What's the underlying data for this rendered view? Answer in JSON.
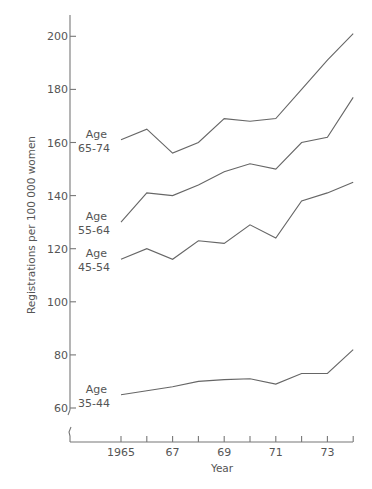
{
  "chart_data": {
    "type": "line",
    "title": "",
    "xlabel": "Year",
    "ylabel": "Registrations per 100 000 women",
    "x": [
      1965,
      1966,
      1967,
      1968,
      1969,
      1970,
      1971,
      1972,
      1973,
      1974
    ],
    "x_ticks": [
      1965,
      1966,
      1967,
      1968,
      1969,
      1970,
      1971,
      1972,
      1973,
      1974
    ],
    "x_tick_labels": [
      {
        "value": 1965,
        "label": "1965"
      },
      {
        "value": 1967,
        "label": "67"
      },
      {
        "value": 1969,
        "label": "69"
      },
      {
        "value": 1971,
        "label": "71"
      },
      {
        "value": 1973,
        "label": "73"
      }
    ],
    "y_ticks": [
      60,
      80,
      100,
      120,
      140,
      160,
      180,
      200
    ],
    "y_tick_labels": [
      "60",
      "80",
      "100",
      "120",
      "140",
      "160",
      "180",
      "200"
    ],
    "ylim": [
      60,
      200
    ],
    "xlim": [
      1965,
      1974
    ],
    "y_axis_break": true,
    "grid": false,
    "legend": "inline-left",
    "series": [
      {
        "name": "Age 65-74",
        "label_lines": [
          "Age",
          "65-74"
        ],
        "values": [
          161,
          165,
          156,
          160,
          169,
          168,
          169,
          180,
          191,
          201
        ]
      },
      {
        "name": "Age 55-64",
        "label_lines": [
          "Age",
          "55-64"
        ],
        "values": [
          130,
          141,
          140,
          144,
          149,
          152,
          150,
          160,
          162,
          177
        ]
      },
      {
        "name": "Age 45-54",
        "label_lines": [
          "Age",
          "45-54"
        ],
        "values": [
          116,
          120,
          116,
          123,
          122,
          129,
          124,
          138,
          141,
          145
        ]
      },
      {
        "name": "Age 35-44",
        "label_lines": [
          "Age",
          "35-44"
        ],
        "values": [
          65,
          66.5,
          68,
          70,
          70.7,
          71,
          69,
          73,
          73,
          82
        ]
      }
    ]
  }
}
